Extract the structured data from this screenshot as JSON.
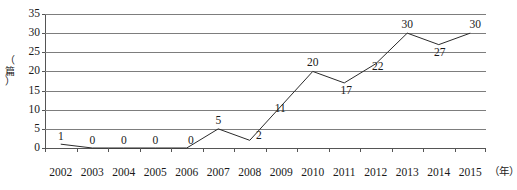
{
  "chart_data": {
    "type": "line",
    "title": "",
    "xlabel": "（年）",
    "ylabel": "（篇）",
    "categories": [
      "2002",
      "2003",
      "2004",
      "2005",
      "2006",
      "2007",
      "2008",
      "2009",
      "2010",
      "2011",
      "2012",
      "2013",
      "2014",
      "2015"
    ],
    "values": [
      1,
      0,
      0,
      0,
      0,
      5,
      2,
      11,
      20,
      17,
      22,
      30,
      27,
      30
    ],
    "ylim": [
      0,
      35
    ],
    "ytick_labels": [
      "0",
      "5",
      "10",
      "15",
      "20",
      "25",
      "30",
      "35"
    ],
    "ytick_values": [
      0,
      5,
      10,
      15,
      20,
      25,
      30,
      35
    ],
    "grid": true,
    "legend": false,
    "series": [
      {
        "name": "",
        "values": [
          1,
          0,
          0,
          0,
          0,
          5,
          2,
          11,
          20,
          17,
          22,
          30,
          27,
          30
        ]
      }
    ],
    "data_labels": [
      "1",
      "0",
      "0",
      "0",
      "0",
      "5",
      "2",
      "11",
      "20",
      "17",
      "22",
      "30",
      "27",
      "30"
    ],
    "colors": {
      "line": "#2b2b2b",
      "grid": "#7d7d7d",
      "axis": "#555555",
      "text": "#1a1a1a",
      "background": "#ffffff"
    }
  },
  "axes": {
    "y_unit_label": "（\n篇\n）",
    "x_unit_label": "（年）"
  }
}
